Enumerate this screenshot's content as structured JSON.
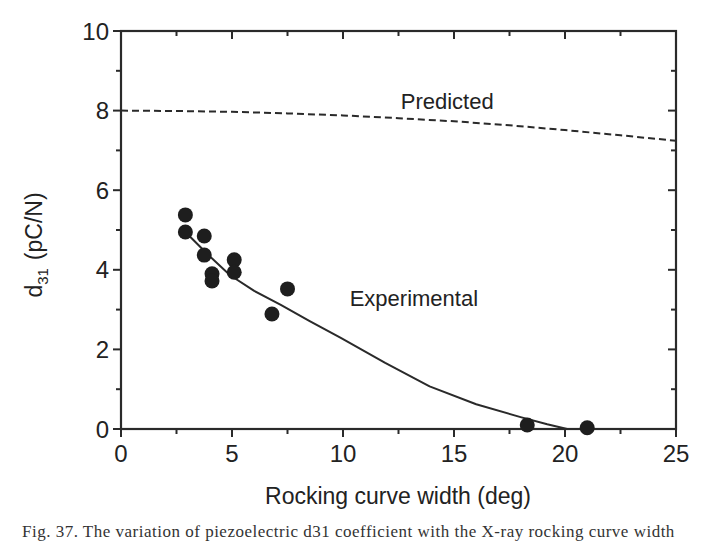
{
  "chart_data": {
    "type": "scatter",
    "title": "",
    "xlabel": "Rocking curve width (deg)",
    "ylabel_main": "d",
    "ylabel_sub": "31",
    "ylabel_units": "(pC/N)",
    "xlim": [
      0,
      25
    ],
    "ylim": [
      0,
      10
    ],
    "xticks": [
      0,
      5,
      10,
      15,
      20,
      25
    ],
    "yticks": [
      0,
      2,
      4,
      6,
      8,
      10
    ],
    "grid": false,
    "legend": "none",
    "series": [
      {
        "name": "Experimental",
        "kind": "points",
        "x": [
          2.9,
          2.9,
          3.75,
          3.75,
          4.1,
          4.1,
          5.1,
          5.1,
          6.8,
          7.5,
          18.3,
          21.0
        ],
        "y": [
          5.38,
          4.95,
          4.85,
          4.37,
          3.9,
          3.72,
          4.25,
          3.94,
          2.89,
          3.52,
          0.1,
          0.03
        ]
      },
      {
        "name": "Experimental fit",
        "kind": "solid-line",
        "x": [
          2.9,
          3.9,
          4.9,
          6.0,
          7.2,
          8.5,
          9.9,
          11.9,
          13.9,
          16.0,
          18.0,
          19.2,
          20.1
        ],
        "y": [
          4.95,
          4.39,
          3.87,
          3.47,
          3.12,
          2.71,
          2.29,
          1.66,
          1.07,
          0.62,
          0.3,
          0.12,
          0.0
        ]
      },
      {
        "name": "Predicted",
        "kind": "dashed-line",
        "x": [
          0,
          2.5,
          5,
          7.5,
          10,
          12.5,
          15,
          17.5,
          20,
          22.5,
          25
        ],
        "y": [
          8.0,
          7.99,
          7.97,
          7.93,
          7.88,
          7.81,
          7.73,
          7.63,
          7.51,
          7.38,
          7.24
        ]
      }
    ],
    "annotations": [
      {
        "text": "Predicted",
        "x": 12.6,
        "y": 8.05
      },
      {
        "text": "Experimental",
        "x": 10.3,
        "y": 3.08
      }
    ]
  },
  "caption": "Fig. 37.   The variation of piezoelectric d31 coefficient with the X-ray rocking curve width"
}
